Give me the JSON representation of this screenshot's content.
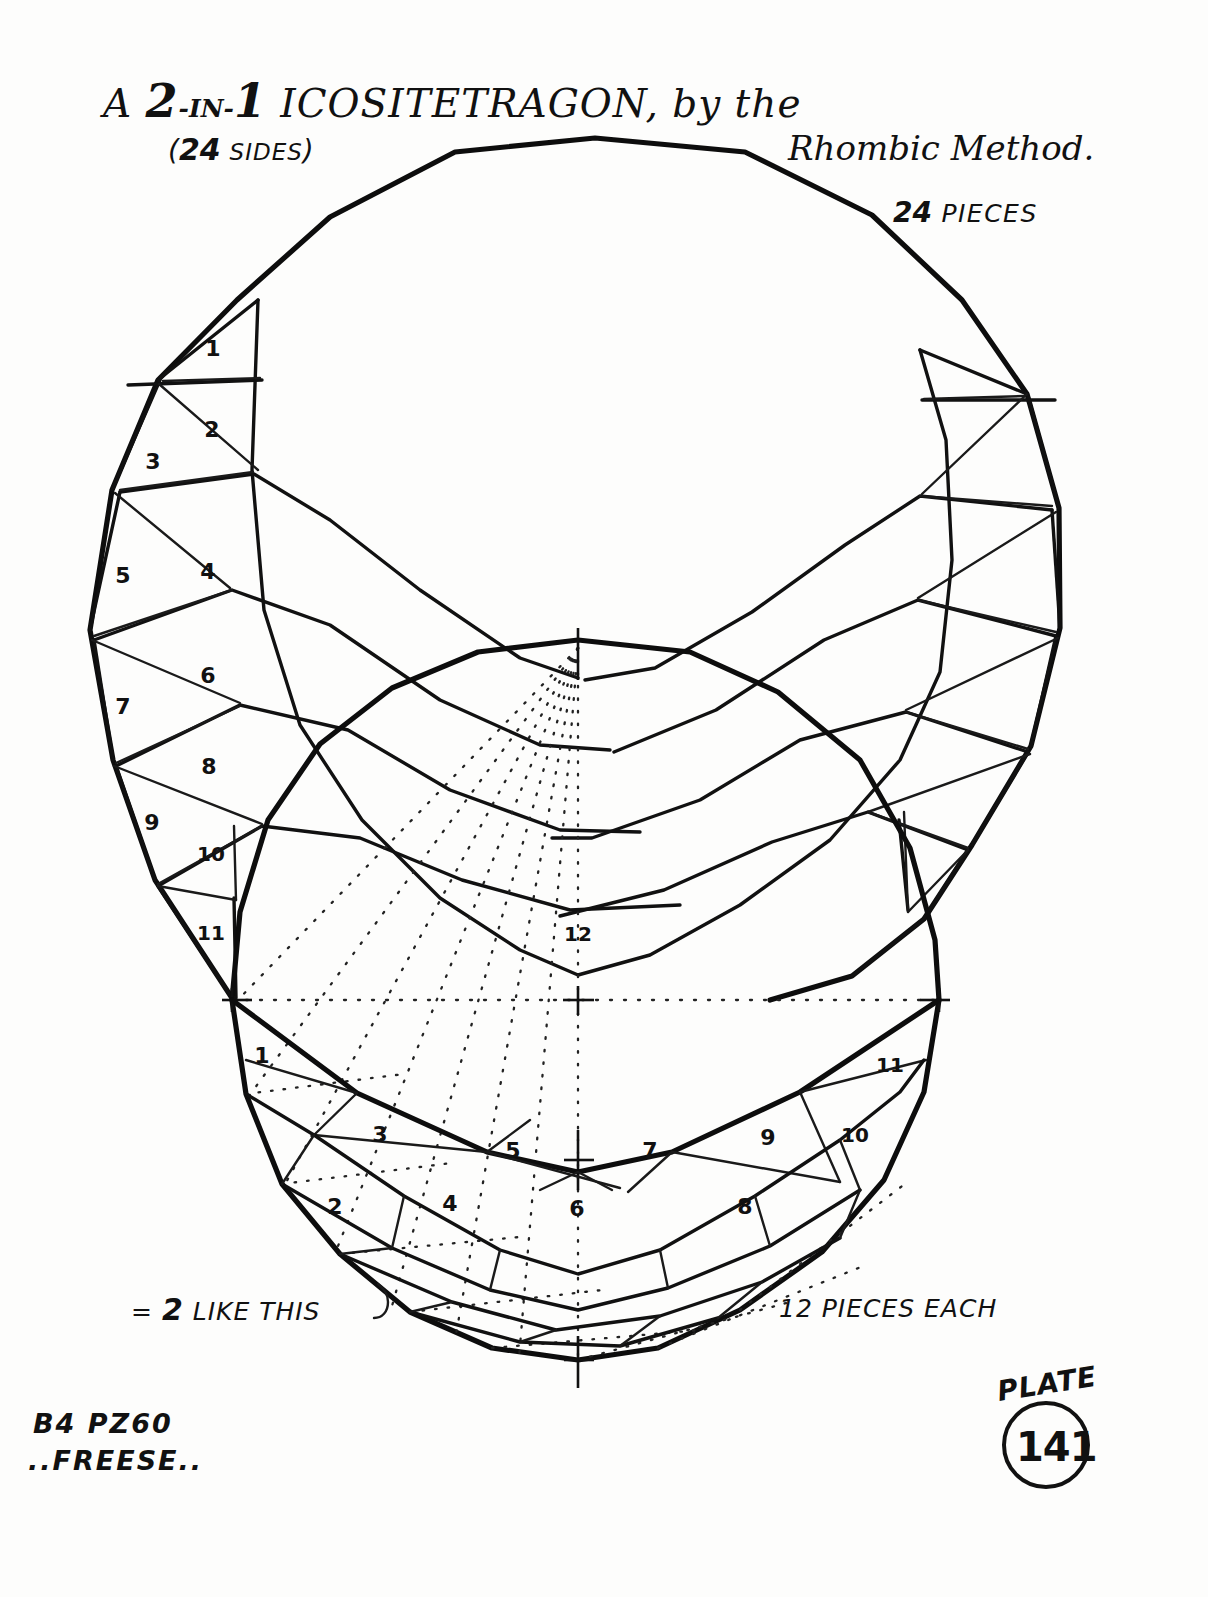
{
  "document": {
    "title_line1_a": "A ",
    "title_line1_big1": "2",
    "title_line1_small1": "-IN-",
    "title_line1_big2": "1",
    "title_line1_rest": " ICOSITETRAGON, by the",
    "title_line2": "Rhombic Method.",
    "sides_note_num": "24",
    "sides_note_label": "SIDES",
    "pieces_note_num": "24",
    "pieces_note_label": "PIECES",
    "center_piece_label": "12",
    "note_left_eq": "=",
    "note_left_num": "2",
    "note_left_text": "LIKE THIS",
    "note_right": "12 PIECES EACH",
    "signature_line1": "B4 PZ60",
    "signature_line2": "..FREESE..",
    "plate_word": "PLATE",
    "plate_number": "141"
  },
  "upper_polygon": {
    "name": "icositetragon-upper",
    "sides": 24,
    "piece_labels_left": [
      "1",
      "2",
      "3",
      "4",
      "5",
      "6",
      "7",
      "8",
      "9",
      "10",
      "11"
    ],
    "center_label": "12"
  },
  "lower_polygon": {
    "name": "icositetragon-lower",
    "sides": 24,
    "piece_labels": [
      "1",
      "2",
      "3",
      "4",
      "5",
      "6",
      "7",
      "8",
      "9",
      "10",
      "11"
    ],
    "center_label": "12"
  },
  "chart_data": {
    "type": "diagram",
    "subtitle": "(24 SIDES) / 24 PIECES",
    "annotations": [
      "= 2 LIKE THIS",
      "12 PIECES EACH"
    ],
    "upper_piece_numbers": [
      1,
      2,
      3,
      4,
      5,
      6,
      7,
      8,
      9,
      10,
      11,
      12
    ],
    "lower_piece_numbers": [
      1,
      2,
      3,
      4,
      5,
      6,
      7,
      8,
      9,
      10,
      11,
      12
    ],
    "plate": "141"
  },
  "upper_numbers": [
    {
      "n": "1",
      "x": 213,
      "y": 348
    },
    {
      "n": "2",
      "x": 212,
      "y": 429
    },
    {
      "n": "3",
      "x": 153,
      "y": 461
    },
    {
      "n": "4",
      "x": 208,
      "y": 571
    },
    {
      "n": "5",
      "x": 123,
      "y": 575
    },
    {
      "n": "6",
      "x": 208,
      "y": 675
    },
    {
      "n": "7",
      "x": 123,
      "y": 706
    },
    {
      "n": "8",
      "x": 209,
      "y": 766
    },
    {
      "n": "9",
      "x": 152,
      "y": 822
    },
    {
      "n": "10",
      "x": 211,
      "y": 854
    },
    {
      "n": "11",
      "x": 211,
      "y": 933
    },
    {
      "n": "12",
      "x": 578,
      "y": 934
    }
  ],
  "lower_numbers": [
    {
      "n": "1",
      "x": 262,
      "y": 1055
    },
    {
      "n": "2",
      "x": 335,
      "y": 1206
    },
    {
      "n": "3",
      "x": 380,
      "y": 1134
    },
    {
      "n": "4",
      "x": 450,
      "y": 1203
    },
    {
      "n": "5",
      "x": 513,
      "y": 1150
    },
    {
      "n": "6",
      "x": 577,
      "y": 1208
    },
    {
      "n": "7",
      "x": 650,
      "y": 1150
    },
    {
      "n": "8",
      "x": 745,
      "y": 1206
    },
    {
      "n": "9",
      "x": 768,
      "y": 1137
    },
    {
      "n": "10",
      "x": 855,
      "y": 1135
    },
    {
      "n": "11",
      "x": 890,
      "y": 1065
    }
  ]
}
